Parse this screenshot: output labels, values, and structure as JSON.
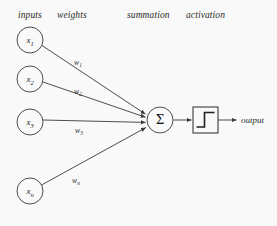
{
  "figure": {
    "background_color": "#f9f9f9",
    "stroke_color": "#3a3a3a",
    "text_color": "#2b2b2b"
  },
  "headers": [
    {
      "id": "inputs",
      "label": "inputs",
      "x": 18,
      "y": 16
    },
    {
      "id": "weights",
      "label": "weights",
      "x": 57,
      "y": 16
    },
    {
      "id": "summation",
      "label": "summation",
      "x": 127,
      "y": 16
    },
    {
      "id": "activation",
      "label": "activation",
      "x": 186,
      "y": 16
    }
  ],
  "input_nodes": [
    {
      "id": "x1",
      "base": "x",
      "sub": "1",
      "cx": 30,
      "cy": 40,
      "r": 13
    },
    {
      "id": "x2",
      "base": "x",
      "sub": "2",
      "cx": 30,
      "cy": 79,
      "r": 13
    },
    {
      "id": "x3",
      "base": "x",
      "sub": "3",
      "cx": 30,
      "cy": 122,
      "r": 13
    },
    {
      "id": "xn",
      "base": "x",
      "sub": "n",
      "cx": 30,
      "cy": 191,
      "r": 13
    }
  ],
  "weights": [
    {
      "id": "w1",
      "base": "w",
      "sub": "1",
      "x": 78,
      "y": 63
    },
    {
      "id": "w2",
      "base": "w",
      "sub": "2",
      "x": 78,
      "y": 92
    },
    {
      "id": "w3",
      "base": "w",
      "sub": "3",
      "x": 79,
      "y": 131
    },
    {
      "id": "wn",
      "base": "w",
      "sub": "n",
      "x": 76,
      "y": 181
    }
  ],
  "summation_node": {
    "symbol": "Σ",
    "cx": 160,
    "cy": 120,
    "r": 13
  },
  "activation_box": {
    "glyph_name": "step-function-glyph",
    "x": 193,
    "y": 107,
    "width": 25,
    "height": 26
  },
  "output": {
    "label": "output",
    "x": 241,
    "y": 120
  }
}
